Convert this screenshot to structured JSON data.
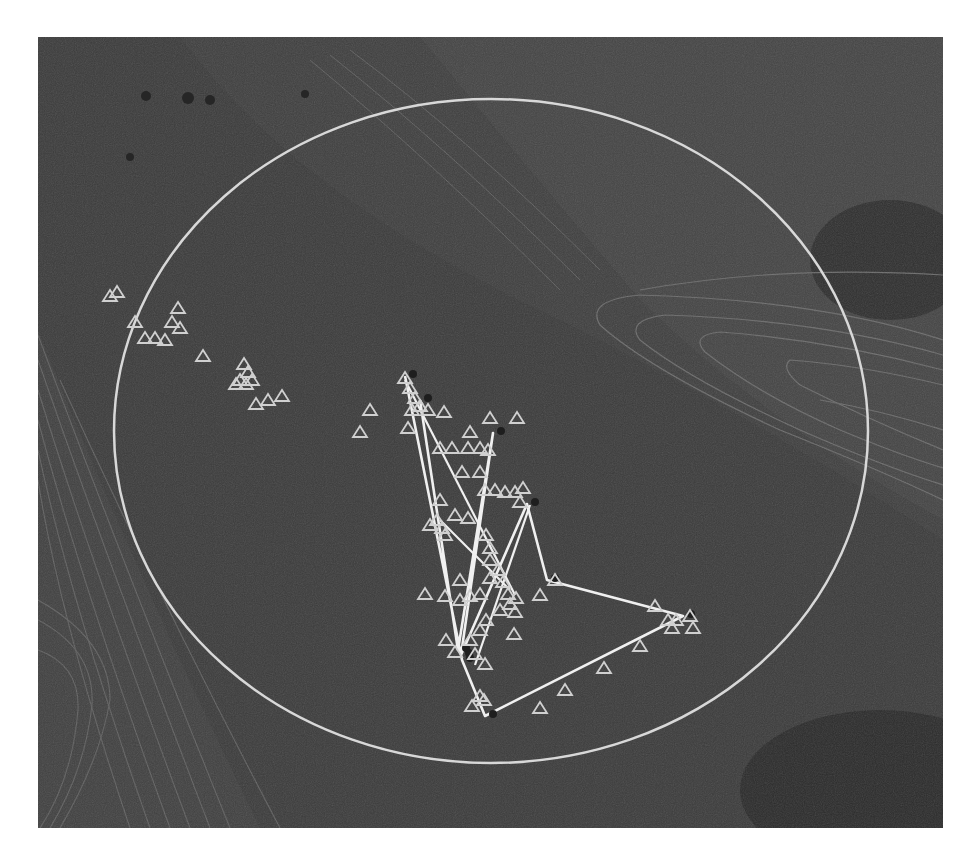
{
  "map": {
    "background_color": "#3b3b3b",
    "terrain_dark_color": "#303030",
    "contour_color": "#6e6e6e",
    "boundary_color": "#d8d8d8",
    "track_color": "#f0f0f0",
    "marker_color": "#d0d0d0",
    "boundary": {
      "shape": "ellipse",
      "cx": 491,
      "cy": 431,
      "rx": 377,
      "ry": 332
    },
    "track_vertices": [
      [
        405,
        376
      ],
      [
        462,
        660
      ],
      [
        485,
        716
      ],
      [
        683,
        616
      ],
      [
        547,
        580
      ],
      [
        527,
        504
      ],
      [
        461,
        655
      ],
      [
        493,
        433
      ],
      [
        458,
        650
      ],
      [
        420,
        400
      ]
    ],
    "track_extra_segments": [
      [
        [
          440,
          520
        ],
        [
          510,
          590
        ]
      ],
      [
        [
          475,
          665
        ],
        [
          530,
          505
        ]
      ],
      [
        [
          405,
          380
        ],
        [
          515,
          595
        ]
      ]
    ],
    "marker_clusters": [
      {
        "points": [
          [
            117,
            292
          ],
          [
            110,
            296
          ],
          [
            178,
            308
          ],
          [
            172,
            322
          ],
          [
            180,
            328
          ],
          [
            145,
            338
          ],
          [
            155,
            338
          ],
          [
            165,
            340
          ],
          [
            135,
            322
          ],
          [
            203,
            356
          ]
        ]
      },
      {
        "points": [
          [
            244,
            364
          ],
          [
            248,
            372
          ],
          [
            240,
            380
          ],
          [
            236,
            384
          ],
          [
            246,
            384
          ],
          [
            252,
            380
          ],
          [
            256,
            404
          ],
          [
            268,
            400
          ],
          [
            282,
            396
          ]
        ]
      },
      {
        "points": [
          [
            405,
            378
          ],
          [
            410,
            388
          ],
          [
            415,
            398
          ],
          [
            420,
            406
          ],
          [
            412,
            410
          ],
          [
            428,
            410
          ],
          [
            444,
            412
          ],
          [
            370,
            410
          ],
          [
            360,
            432
          ],
          [
            408,
            428
          ]
        ]
      },
      {
        "points": [
          [
            490,
            418
          ],
          [
            517,
            418
          ],
          [
            470,
            432
          ],
          [
            440,
            448
          ],
          [
            452,
            448
          ],
          [
            468,
            448
          ],
          [
            480,
            448
          ],
          [
            488,
            450
          ],
          [
            480,
            472
          ],
          [
            462,
            472
          ]
        ]
      },
      {
        "points": [
          [
            440,
            500
          ],
          [
            437,
            520
          ],
          [
            442,
            528
          ],
          [
            430,
            525
          ],
          [
            445,
            535
          ],
          [
            455,
            515
          ],
          [
            468,
            518
          ],
          [
            485,
            490
          ],
          [
            495,
            490
          ],
          [
            505,
            492
          ],
          [
            515,
            492
          ]
        ]
      },
      {
        "points": [
          [
            523,
            488
          ],
          [
            520,
            502
          ],
          [
            486,
            535
          ],
          [
            490,
            548
          ],
          [
            490,
            560
          ],
          [
            498,
            570
          ],
          [
            503,
            582
          ],
          [
            508,
            594
          ],
          [
            516,
            598
          ],
          [
            510,
            604
          ],
          [
            515,
            612
          ]
        ]
      },
      {
        "points": [
          [
            425,
            594
          ],
          [
            445,
            596
          ],
          [
            460,
            580
          ],
          [
            460,
            600
          ],
          [
            470,
            596
          ],
          [
            480,
            594
          ],
          [
            490,
            578
          ],
          [
            486,
            620
          ],
          [
            480,
            630
          ],
          [
            500,
            610
          ],
          [
            514,
            634
          ]
        ]
      },
      {
        "points": [
          [
            446,
            640
          ],
          [
            455,
            652
          ],
          [
            470,
            640
          ],
          [
            475,
            654
          ],
          [
            485,
            664
          ],
          [
            480,
            696
          ],
          [
            472,
            706
          ],
          [
            484,
            700
          ]
        ]
      },
      {
        "points": [
          [
            540,
            595
          ],
          [
            555,
            580
          ],
          [
            540,
            708
          ],
          [
            565,
            690
          ],
          [
            604,
            668
          ],
          [
            640,
            646
          ],
          [
            655,
            606
          ],
          [
            668,
            620
          ],
          [
            676,
            620
          ],
          [
            672,
            628
          ],
          [
            690,
            616
          ],
          [
            693,
            628
          ]
        ]
      }
    ]
  }
}
